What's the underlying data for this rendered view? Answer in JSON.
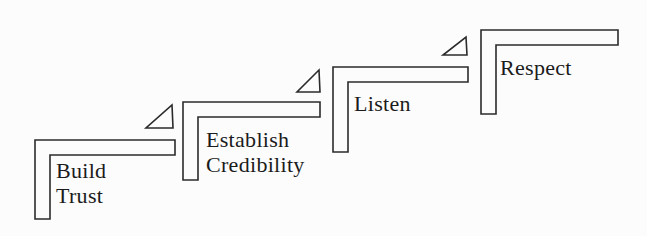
{
  "diagram": {
    "steps": [
      {
        "id": "build-trust",
        "lines": [
          "Build",
          "Trust"
        ]
      },
      {
        "id": "establish-credibility",
        "lines": [
          "Establish",
          "Credibility"
        ]
      },
      {
        "id": "listen",
        "lines": [
          "Listen"
        ]
      },
      {
        "id": "respect",
        "lines": [
          "Respect"
        ]
      }
    ],
    "icons": {
      "between_steps": "incline-triangle-icon"
    },
    "colors": {
      "background": "#fcfcfc",
      "stroke": "#2b2b2b",
      "text": "#1b1b1b"
    }
  }
}
